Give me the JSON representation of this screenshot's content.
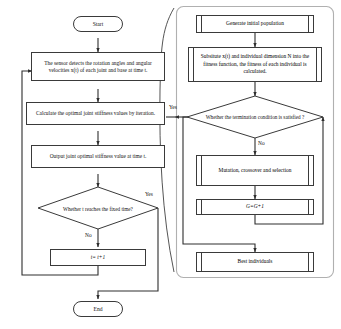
{
  "diagram": {
    "colors": {
      "stroke": "#3a3a3a",
      "text": "#111111",
      "background": "#ffffff",
      "panel_border": "#9a9a9a"
    },
    "left_branch": {
      "start": "Start",
      "sensor_step": "The sensor detects the rotation angles and angular velocities x(t) of each joint and base at time t.",
      "calculate_step": "Calculate the optimal joint stiffness values by iteration.",
      "output_step": "Output joint optimal stiffness value at time t.",
      "decision": "Whether t reaches the fixed time?",
      "decision_yes": "Yes",
      "decision_no": "No",
      "increment_step": "t= t+1",
      "end": "End"
    },
    "right_branch": {
      "generate_step": "Generate initial population",
      "fitness_step": "Subsitute x(t) and individual dimension N into the fitness function, the fitness of each individual is calculated.",
      "decision": "Whether the termination condition is satisfied ?",
      "decision_yes": "Yes",
      "decision_no": "No",
      "mutation_step": "Mutation, crossover and selection",
      "generation_step": "G=G+1",
      "best_step": "Best individuals"
    }
  }
}
